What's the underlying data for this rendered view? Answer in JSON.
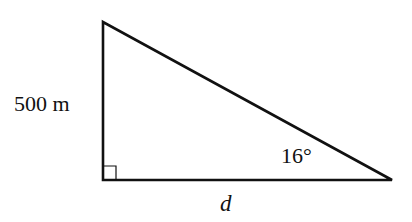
{
  "diagram": {
    "type": "right-triangle",
    "labels": {
      "vertical_side": "500 m",
      "angle": "16°",
      "horizontal_side": "d"
    },
    "right_angle_marker": true,
    "colors": {
      "stroke": "#111111",
      "background": "#ffffff"
    }
  }
}
